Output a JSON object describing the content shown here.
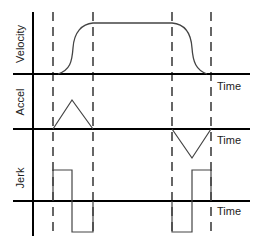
{
  "diagram": {
    "type": "motion-profile",
    "rows": [
      {
        "id": "velocity",
        "label": "Velocity",
        "axis_label": "Time"
      },
      {
        "id": "accel",
        "label": "Accel",
        "axis_label": "Time"
      },
      {
        "id": "jerk",
        "label": "Jerk",
        "axis_label": "Time"
      }
    ],
    "phases_x": [
      53,
      93,
      172,
      211
    ],
    "colors": {
      "line": "#000000",
      "curve": "#444444"
    }
  }
}
